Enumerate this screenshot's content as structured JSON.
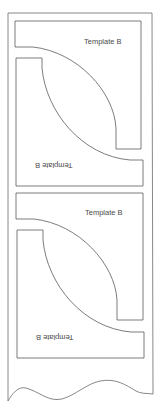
{
  "document": {
    "type": "pattern-template-sheet",
    "colors": {
      "line": "#5a5a5a",
      "background": "#ffffff"
    }
  },
  "templates": [
    {
      "id": "set-1",
      "top_label": "Template B",
      "bottom_label": "Template B"
    },
    {
      "id": "set-2",
      "top_label": "Template B",
      "bottom_label": "Template B"
    }
  ]
}
